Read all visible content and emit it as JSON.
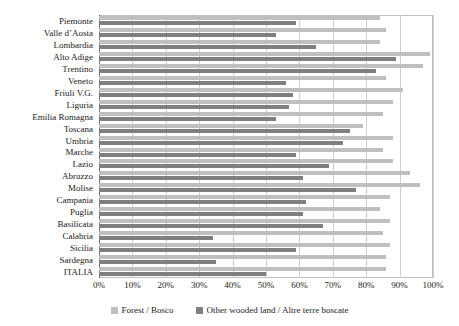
{
  "chart_data": {
    "type": "bar",
    "orientation": "horizontal",
    "title": "",
    "xlabel": "",
    "ylabel": "",
    "xlim": [
      0,
      100
    ],
    "grid": true,
    "legend_position": "bottom",
    "xtick_labels": [
      "0%",
      "10%",
      "20%",
      "30%",
      "40%",
      "50%",
      "60%",
      "70%",
      "80%",
      "90%",
      "100%"
    ],
    "xtick_values": [
      0,
      10,
      20,
      30,
      40,
      50,
      60,
      70,
      80,
      90,
      100
    ],
    "categories": [
      "Piemonte",
      "Valle d’Aosta",
      "Lombardia",
      "Alto Adige",
      "Trentino",
      "Veneto",
      "Friuli V.G.",
      "Liguria",
      "Emilia Romagna",
      "Toscana",
      "Umbria",
      "Marche",
      "Lazio",
      "Abruzzo",
      "Molise",
      "Campania",
      "Puglia",
      "Basilicata",
      "Calabria",
      "Sicilia",
      "Sardegna",
      "ITALIA"
    ],
    "series": [
      {
        "name": "Forest / Bosco",
        "color": "#bfbfbf",
        "values": [
          84,
          86,
          84,
          99,
          97,
          86,
          91,
          88,
          85,
          79,
          88,
          85,
          88,
          93,
          96,
          87,
          84,
          87,
          85,
          87,
          86,
          86
        ]
      },
      {
        "name": "Other wooded land / Altre terre boscate",
        "color": "#7f7f7f",
        "values": [
          59,
          53,
          65,
          89,
          83,
          56,
          58,
          57,
          53,
          75,
          73,
          59,
          69,
          61,
          77,
          62,
          61,
          67,
          34,
          59,
          35,
          50
        ]
      }
    ],
    "legend": [
      {
        "label": "Forest / Bosco",
        "color": "#bfbfbf",
        "swatch": "forest"
      },
      {
        "label": "Other wooded land / Altre terre boscate",
        "color": "#7f7f7f",
        "swatch": "other"
      }
    ]
  },
  "colors": {
    "forest": "#bfbfbf",
    "other_wooded": "#7f7f7f",
    "gridline": "#cfcfcf",
    "axis": "#6b6b6b",
    "text": "#1a1a1a",
    "background": "#ffffff"
  }
}
